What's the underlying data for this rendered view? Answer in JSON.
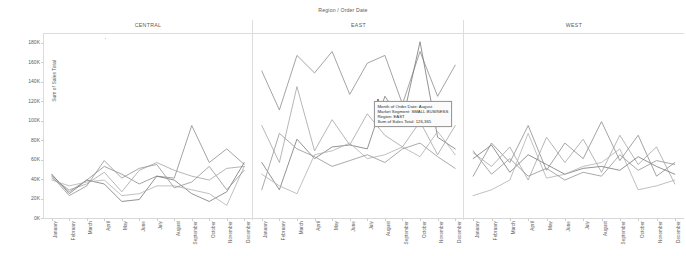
{
  "chart_title": "Region / Order Date",
  "yaxis_title": "Sum of Sales Total",
  "yticks": [
    "0K",
    "20K",
    "40K",
    "60K",
    "80K",
    "100K",
    "120K",
    "140K",
    "160K",
    "180K"
  ],
  "months": [
    "January",
    "February",
    "March",
    "April",
    "May",
    "June",
    "July",
    "August",
    "September",
    "October",
    "November",
    "December"
  ],
  "panels": [
    {
      "header": "CENTRAL"
    },
    {
      "header": "EAST"
    },
    {
      "header": "WEST"
    }
  ],
  "tooltip": {
    "line1": "Month of Order Date: August",
    "line2": "Market Segment: SMALL BUSINESS",
    "line3": "Region: EAST",
    "line4": "Sum of Sales Total: 126,365"
  },
  "colors": {
    "series1": "#8c8c8c",
    "series2": "#a3a3a3",
    "series3": "#777777",
    "series4": "#b0b0b0",
    "series5": "#949494",
    "axis": "#5a5a5a",
    "grid": "#dcdcdc",
    "background": "#ffffff"
  },
  "chart_data": {
    "type": "line",
    "title": "Region / Order Date",
    "xlabel": "",
    "ylabel": "Sum of Sales Total",
    "ylim": [
      0,
      190000
    ],
    "grid": false,
    "legend": "none",
    "categories": [
      "January",
      "February",
      "March",
      "April",
      "May",
      "June",
      "July",
      "August",
      "September",
      "October",
      "November",
      "December"
    ],
    "panels": [
      {
        "name": "CENTRAL",
        "series": [
          {
            "name": "CONSUMER",
            "values": [
              45000,
              28000,
              40000,
              54000,
              46000,
              36000,
              44000,
              42000,
              96000,
              58000,
              72000,
              56000
            ]
          },
          {
            "name": "CORPORATE",
            "values": [
              42000,
              30000,
              36000,
              48000,
              28000,
              50000,
              58000,
              50000,
              44000,
              40000,
              52000,
              54000
            ]
          },
          {
            "name": "HOME OFFICE",
            "values": [
              46000,
              26000,
              40000,
              36000,
              18000,
              20000,
              44000,
              40000,
              26000,
              18000,
              28000,
              58000
            ]
          },
          {
            "name": "SMALL BUSINESS",
            "values": [
              40000,
              34000,
              38000,
              40000,
              24000,
              26000,
              34000,
              34000,
              30000,
              26000,
              14000,
              54000
            ]
          },
          {
            "name": "OTHER",
            "values": [
              44000,
              24000,
              34000,
              60000,
              42000,
              52000,
              56000,
              32000,
              38000,
              54000,
              30000,
              50000
            ]
          }
        ]
      },
      {
        "name": "EAST",
        "series": [
          {
            "name": "CONSUMER",
            "values": [
              152000,
              112000,
              168000,
              150000,
              172000,
              128000,
              160000,
              168000,
              118000,
              172000,
              126000,
              158000
            ]
          },
          {
            "name": "CORPORATE",
            "values": [
              96000,
              58000,
              136000,
              70000,
              102000,
              76000,
              108000,
              86000,
              74000,
              100000,
              66000,
              96000
            ]
          },
          {
            "name": "HOME OFFICE",
            "values": [
              58000,
              30000,
              82000,
              62000,
              74000,
              76000,
              72000,
              126000,
              100000,
              182000,
              84000,
              72000
            ]
          },
          {
            "name": "SMALL BUSINESS",
            "values": [
              46000,
              34000,
              26000,
              66000,
              70000,
              78000,
              62000,
              66000,
              74000,
              64000,
              90000,
              66000
            ]
          },
          {
            "name": "OTHER",
            "values": [
              30000,
              88000,
              72000,
              64000,
              54000,
              60000,
              66000,
              58000,
              72000,
              78000,
              64000,
              52000
            ]
          }
        ]
      },
      {
        "name": "WEST",
        "series": [
          {
            "name": "CONSUMER",
            "values": [
              44000,
              78000,
              58000,
              96000,
              50000,
              78000,
              62000,
              100000,
              60000,
              86000,
              44000,
              58000
            ]
          },
          {
            "name": "CORPORATE",
            "values": [
              68000,
              54000,
              74000,
              40000,
              84000,
              58000,
              82000,
              48000,
              86000,
              56000,
              74000,
              36000
            ]
          },
          {
            "name": "HOME OFFICE",
            "values": [
              62000,
              76000,
              48000,
              66000,
              56000,
              46000,
              52000,
              54000,
              50000,
              64000,
              54000,
              46000
            ]
          },
          {
            "name": "SMALL BUSINESS",
            "values": [
              24000,
              30000,
              40000,
              88000,
              42000,
              46000,
              54000,
              58000,
              72000,
              30000,
              34000,
              40000
            ]
          },
          {
            "name": "OTHER",
            "values": [
              70000,
              46000,
              62000,
              44000,
              52000,
              40000,
              48000,
              44000,
              66000,
              50000,
              60000,
              56000
            ]
          }
        ]
      }
    ]
  }
}
